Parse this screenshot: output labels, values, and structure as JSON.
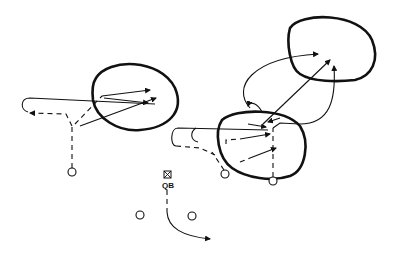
{
  "diagram": {
    "type": "football-play",
    "labels": {
      "qb": "QB"
    },
    "elements": {
      "zones": [
        "left-zone",
        "right-deep-zone",
        "right-underneath-zone"
      ],
      "players": [
        "qb",
        "left-back",
        "left-receiver",
        "right-back",
        "right-receiver-1",
        "right-receiver-2"
      ]
    },
    "colors": {
      "ink": "#111111",
      "background": "#ffffff"
    }
  }
}
